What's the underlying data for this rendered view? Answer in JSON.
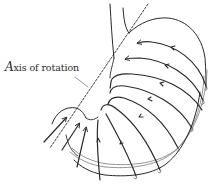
{
  "figure": {
    "label_first_letter": "A",
    "label_rest": "xis of rotation",
    "label_full": "Axis of rotation",
    "colors": {
      "ink": "#2a2a2a",
      "light_ink": "#7a7a7a",
      "background": "#ffffff"
    },
    "elements": [
      {
        "name": "esophagus",
        "type": "tube-outline"
      },
      {
        "name": "axis-of-rotation",
        "type": "dashed-line"
      },
      {
        "name": "stomach-outline",
        "type": "curved-outline"
      },
      {
        "name": "muscle-fiber-arcs",
        "type": "arrowed-curves",
        "count": 7,
        "direction": "circular around axis"
      },
      {
        "name": "pylorus-arrows",
        "type": "straight-arrows",
        "count": 3
      }
    ]
  }
}
